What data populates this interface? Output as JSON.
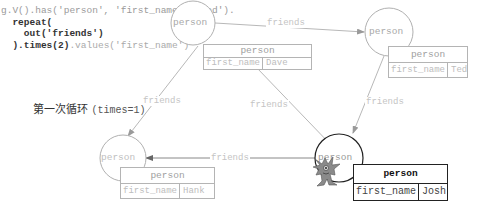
{
  "code": {
    "line1": "g.V().has('person', 'first_name', 'Ted').",
    "line2": "repeat(",
    "line3": "out('friends')",
    "line4_bold": ").times(2)",
    "line4_light": ".values('first_name')"
  },
  "iteration_label": {
    "text": "第一次循环",
    "param": "(times=1)"
  },
  "vertices": [
    {
      "id": "dave",
      "circle_label": "person",
      "box_label": "person",
      "property_key": "first_name",
      "property_value": "Dave",
      "active": false
    },
    {
      "id": "ted",
      "circle_label": "person",
      "box_label": "person",
      "property_key": "first_name",
      "property_value": "Ted",
      "active": false
    },
    {
      "id": "hank",
      "circle_label": "person",
      "box_label": "person",
      "property_key": "first_name",
      "property_value": "Hank",
      "active": false
    },
    {
      "id": "josh",
      "circle_label": "person",
      "box_label": "person",
      "property_key": "first_name",
      "property_value": "Josh",
      "active": true
    }
  ],
  "edges": [
    {
      "from": "dave",
      "to": "ted",
      "label": "friends"
    },
    {
      "from": "dave",
      "to": "hank",
      "label": "friends"
    },
    {
      "from": "dave",
      "to": "josh",
      "label": "friends"
    },
    {
      "from": "ted",
      "to": "josh",
      "label": "friends"
    },
    {
      "from": "josh",
      "to": "hank",
      "label": "friends"
    }
  ],
  "colors": {
    "inactive": "#b4b4b4",
    "active": "#222222",
    "edge": "#b8b8b8"
  },
  "traverser_icon": "gremlin-icon"
}
